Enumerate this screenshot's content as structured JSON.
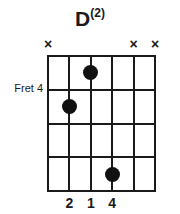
{
  "chord": {
    "title_root": "D",
    "title_superscript": "(2)",
    "fret_label": "Fret 4",
    "fret_label_row": 1,
    "num_strings": 6,
    "num_frets": 4,
    "string_order_note": "string index 1 = leftmost (low pitch side as drawn), 6 = rightmost",
    "markers": [
      {
        "string": 1,
        "symbol": "×",
        "meaning": "muted"
      },
      {
        "string": 5,
        "symbol": "×",
        "meaning": "muted"
      },
      {
        "string": 6,
        "symbol": "×",
        "meaning": "muted"
      }
    ],
    "dots": [
      {
        "string": 3,
        "fret": 1
      },
      {
        "string": 2,
        "fret": 2
      },
      {
        "string": 4,
        "fret": 4
      }
    ],
    "fingers": [
      {
        "string": 2,
        "label": "2"
      },
      {
        "string": 3,
        "label": "1"
      },
      {
        "string": 4,
        "label": "4"
      }
    ],
    "colors": {
      "ink": "#1a1a1a",
      "dot": "#111111",
      "background": "#ffffff"
    }
  },
  "geometry": {
    "grid_left": 47,
    "grid_top": 55,
    "grid_width": 109,
    "grid_height": 137,
    "string_spacing": 21.8,
    "fret_spacing": 34.25
  }
}
